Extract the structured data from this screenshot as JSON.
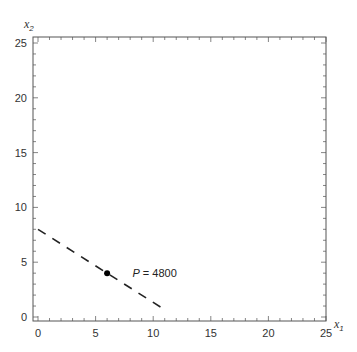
{
  "chart_data": {
    "type": "line",
    "title": "",
    "xlabel": "x1",
    "ylabel": "x2",
    "xlim": [
      0,
      25
    ],
    "ylim": [
      0,
      25
    ],
    "xticks": [
      0,
      5,
      10,
      15,
      20,
      25
    ],
    "yticks": [
      0,
      5,
      10,
      15,
      20,
      25
    ],
    "minor_tick_step": 1,
    "grid": false,
    "frame": true,
    "series": [
      {
        "name": "P = 4800 (isoprofit line)",
        "style": "dashed",
        "color": "#222222",
        "x": [
          0,
          11.1
        ],
        "y": [
          8,
          0.6
        ]
      }
    ],
    "points": [
      {
        "name": "optimal-point",
        "x": 6,
        "y": 4,
        "color": "#000000"
      }
    ],
    "annotations": [
      {
        "text_var": "P",
        "text_rest": " = 4800",
        "x": 8.2,
        "y": 4
      }
    ]
  },
  "labels": {
    "x_main": "x",
    "x_sub": "1",
    "y_main": "x",
    "y_sub": "2",
    "annot_var": "P",
    "annot_rest": " = 4800"
  }
}
